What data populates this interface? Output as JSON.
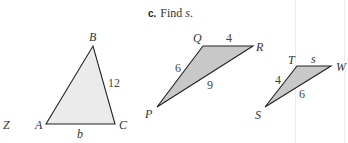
{
  "prompt": {
    "letter": "c.",
    "text": "Find",
    "variable": "s",
    "end": "."
  },
  "stray_label": "Z",
  "triangles": {
    "ABC": {
      "fill": "#ebebeb",
      "vertices": {
        "A": "A",
        "B": "B",
        "C": "C"
      },
      "sides": {
        "BC": "12",
        "AC": "b"
      }
    },
    "PQR": {
      "fill": "#c8c8c8",
      "vertices": {
        "P": "P",
        "Q": "Q",
        "R": "R"
      },
      "sides": {
        "QR": "4",
        "PQ": "6",
        "PR": "9"
      }
    },
    "STW": {
      "fill": "#c8c8c8",
      "vertices": {
        "S": "S",
        "T": "T",
        "W": "W"
      },
      "sides": {
        "TW": "s",
        "ST": "4",
        "SW": "6"
      }
    }
  }
}
